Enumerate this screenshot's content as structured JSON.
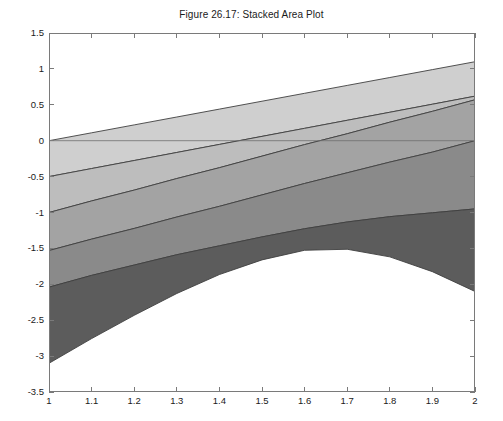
{
  "figure": {
    "title": "Figure 26.17: Stacked Area Plot",
    "background_color": "#ffffff",
    "frame_color": "#7a7a7a",
    "text_color": "#1a1a1a"
  },
  "axes": {
    "x": {
      "label": "",
      "min": 1,
      "max": 2,
      "tick_labels": [
        "1",
        "1.1",
        "1.2",
        "1.3",
        "1.4",
        "1.5",
        "1.6",
        "1.7",
        "1.8",
        "1.9",
        "2"
      ],
      "tick_values": [
        1,
        1.1,
        1.2,
        1.3,
        1.4,
        1.5,
        1.6,
        1.7,
        1.8,
        1.9,
        2
      ]
    },
    "y": {
      "label": "",
      "min": -3.5,
      "max": 1.5,
      "tick_labels": [
        "1.5",
        "1",
        "0.5",
        "0",
        "-0.5",
        "-1",
        "-1.5",
        "-2",
        "-2.5",
        "-3",
        "-3.5"
      ],
      "tick_values": [
        1.5,
        1,
        0.5,
        0,
        -0.5,
        -1,
        -1.5,
        -2,
        -2.5,
        -3,
        -3.5
      ]
    }
  },
  "chart_data": {
    "type": "area",
    "title": "Figure 26.17: Stacked Area Plot",
    "xlabel": "",
    "ylabel": "",
    "xlim": [
      1,
      2
    ],
    "ylim": [
      -3.5,
      1.5
    ],
    "grid": false,
    "legend": "none",
    "stacked": true,
    "edge_color": "#404040",
    "x": [
      1,
      1.1,
      1.2,
      1.3,
      1.4,
      1.5,
      1.6,
      1.7,
      1.8,
      1.9,
      2
    ],
    "series": [
      {
        "name": "series-1",
        "color": "#cfcfcf",
        "values": [
          -0.5,
          -0.38,
          -0.26,
          -0.14,
          -0.02,
          0.1,
          0.22,
          0.34,
          0.46,
          0.58,
          0.7
        ]
      },
      {
        "name": "series-2",
        "color": "#bdbdbd",
        "values": [
          -0.5,
          -0.44,
          -0.39,
          -0.33,
          -0.28,
          -0.22,
          -0.16,
          -0.11,
          -0.05,
          0.0,
          0.06
        ]
      },
      {
        "name": "series-3",
        "color": "#a3a3a3",
        "values": [
          -0.53,
          -0.5,
          -0.47,
          -0.44,
          -0.41,
          -0.38,
          -0.35,
          -0.32,
          -0.3,
          -0.28,
          -0.25
        ]
      },
      {
        "name": "series-4",
        "color": "#8a8a8a",
        "values": [
          -0.51,
          -0.5,
          -0.5,
          -0.51,
          -0.53,
          -0.56,
          -0.6,
          -0.65,
          -0.72,
          -0.8,
          -0.9
        ]
      },
      {
        "name": "series-5",
        "color": "#5c5c5c",
        "values": [
          -1.06,
          -0.88,
          -0.7,
          -0.54,
          -0.4,
          -0.32,
          -0.3,
          -0.38,
          -0.56,
          -0.82,
          -1.15
        ]
      }
    ],
    "cumulative_boundaries": {
      "baseline": [
        0,
        0,
        0,
        0,
        0,
        0,
        0,
        0,
        0,
        0,
        0
      ],
      "after_series_1": [
        -0.5,
        -0.38,
        -0.26,
        -0.14,
        -0.02,
        0.1,
        0.22,
        0.34,
        0.46,
        0.58,
        0.7
      ],
      "after_series_2": [
        -1.0,
        -0.82,
        -0.65,
        -0.47,
        -0.3,
        -0.12,
        0.06,
        0.23,
        0.41,
        0.58,
        0.76
      ],
      "after_series_3": [
        -1.53,
        -1.32,
        -1.12,
        -0.91,
        -0.71,
        -0.5,
        -0.29,
        -0.09,
        0.11,
        0.3,
        0.51
      ],
      "after_series_4": [
        -2.04,
        -1.82,
        -1.62,
        -1.42,
        -1.24,
        -1.06,
        -0.89,
        -0.74,
        -0.61,
        -0.5,
        -0.39
      ],
      "after_series_5": [
        -3.1,
        -2.7,
        -2.32,
        -1.96,
        -1.64,
        -1.38,
        -1.19,
        -1.12,
        -1.17,
        -1.32,
        -1.54
      ]
    },
    "visual_band_endpoints": {
      "description": "Stacked band boundary values read from the plot at x=1 and x=2",
      "at_x_1": [
        0,
        -0.5,
        -1.0,
        -1.53,
        -2.04,
        -3.1
      ],
      "at_x_2": [
        1.1,
        0.62,
        0.57,
        0.0,
        -0.95,
        -2.1
      ]
    }
  }
}
